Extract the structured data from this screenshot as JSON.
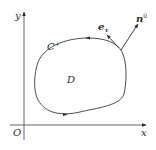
{
  "diagram": {
    "axes": {
      "x_label": "x",
      "y_label": "y",
      "origin_label": "O"
    },
    "curve": {
      "label": "C",
      "label_superscript": "+",
      "region_label": "D",
      "orientation": "counterclockwise"
    },
    "vectors": {
      "tangent": {
        "label": "e",
        "subscript": "τ"
      },
      "normal": {
        "label": "n",
        "superscript": "0"
      }
    },
    "colors": {
      "line": "#3a3a3a",
      "axis": "#555555",
      "background": "#ffffff"
    }
  }
}
